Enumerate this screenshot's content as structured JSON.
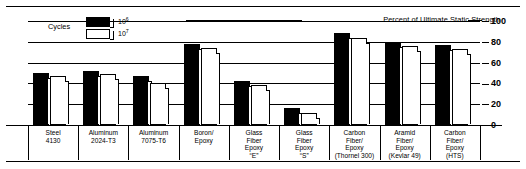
{
  "figure": {
    "header_label": "Percent of Ultimate Static Strength",
    "legend": {
      "title": "Cycles",
      "entries": [
        {
          "name": "dark-swatch",
          "base": "10",
          "exp": "6",
          "fill": "#000000"
        },
        {
          "name": "light-swatch",
          "base": "10",
          "exp": "7",
          "fill": "#ffffff"
        }
      ]
    }
  },
  "chart_data": {
    "type": "bar",
    "title": "Percent of Ultimate Static Strength",
    "xlabel": "",
    "ylabel": "Percent of Ultimate Static Strength",
    "ylim": [
      0,
      100
    ],
    "yticks": [
      0,
      20,
      40,
      60,
      80,
      100
    ],
    "ytick_labels": [
      "0",
      "20",
      "40",
      "60",
      "80",
      "100"
    ],
    "grid": true,
    "legend_position": "top-left",
    "axis_side": "right",
    "categories": [
      "Steel\n4130",
      "Aluminum\n2024-T3",
      "Aluminum\n7075-T6",
      "Boron/\nEpoxy",
      "Glass\nFiber\nEpoxy\n“E”",
      "Glass\nFiber\nEpoxy\n“S”",
      "Carbon\nFiber/\nEpoxy\n(Thornel 300)",
      "Aramid\nFiber/\nEpoxy\n(Kevlar 49)",
      "Carbon\nFiber/\nEpoxy\n(HTS)"
    ],
    "series": [
      {
        "name": "10⁶ cycles",
        "color": "#000000",
        "values": [
          50,
          52,
          47,
          78,
          42,
          16,
          88,
          80,
          77
        ]
      },
      {
        "name": "10⁷ cycles",
        "color": "#ffffff",
        "values": [
          47,
          49,
          40,
          74,
          38,
          12,
          84,
          76,
          73
        ]
      }
    ]
  }
}
